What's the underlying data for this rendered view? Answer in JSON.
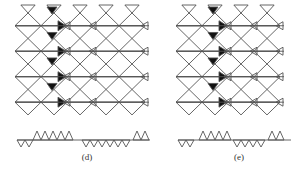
{
  "figure": {
    "panels": [
      {
        "id": "d",
        "label": "(d)",
        "left": 0,
        "width": 151,
        "lattice": {
          "x0": 15,
          "y0": 13,
          "cols": 5,
          "rows": 4,
          "a": 26,
          "shaded_col": 1,
          "inner_cols": [
            1,
            2,
            4
          ]
        },
        "strip": {
          "x0": 17,
          "x1": 150,
          "y": 140,
          "up_from": 33,
          "up_to": 80,
          "down_from": 82,
          "down_to": 130,
          "tooth": 8,
          "tail_up_from": 133,
          "tail_up_to": 150
        },
        "caption_x": 72,
        "caption_y": 152
      },
      {
        "id": "e",
        "label": "(e)",
        "left": 151,
        "width": 151,
        "lattice": {
          "x0": 25,
          "y0": 13,
          "cols": 4,
          "rows": 4,
          "a": 26,
          "shaded_col": 1,
          "inner_cols": [
            1,
            2,
            3
          ]
        },
        "strip": {
          "x0": 27,
          "x1": 140,
          "y": 140,
          "up_from": 48,
          "up_to": 80,
          "down_from": 82,
          "down_to": 115,
          "tooth": 8,
          "tail_up_from": 117,
          "tail_up_to": 140
        },
        "caption_x": 73,
        "caption_y": 152
      }
    ],
    "colors": {
      "line": "#555555",
      "shade": "#111111",
      "background": "#ffffff"
    }
  }
}
